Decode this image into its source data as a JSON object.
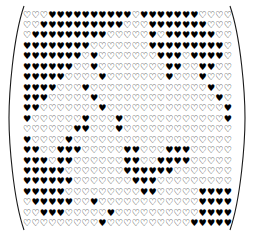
{
  "figure": {
    "kind": "heart-glyph-matrix",
    "rows": 21,
    "cols": 25,
    "glyphs": {
      "filled": "♥",
      "outline": "♡"
    },
    "colors": {
      "ink": "#000000",
      "bracket": "#1a1a1a",
      "background": "#ffffff"
    },
    "bracket_left_name": "left-parenthesis",
    "bracket_right_name": "right-parenthesis"
  },
  "chart_data": {
    "type": "heatmap",
    "title": "",
    "xlabel": "",
    "ylabel": "",
    "legend": [
      "filled = 1",
      "outline = 0"
    ],
    "rows": 21,
    "cols": 25,
    "matrix": [
      [
        0,
        0,
        0,
        1,
        1,
        1,
        1,
        1,
        1,
        1,
        1,
        1,
        1,
        0,
        1,
        1,
        1,
        1,
        1,
        1,
        1,
        0,
        0,
        0,
        0
      ],
      [
        0,
        0,
        1,
        1,
        1,
        1,
        1,
        1,
        1,
        1,
        1,
        1,
        0,
        0,
        0,
        1,
        1,
        1,
        1,
        1,
        1,
        1,
        0,
        0,
        0
      ],
      [
        0,
        1,
        1,
        1,
        1,
        1,
        1,
        1,
        1,
        1,
        0,
        0,
        0,
        0,
        0,
        1,
        0,
        1,
        1,
        1,
        1,
        1,
        1,
        0,
        0
      ],
      [
        1,
        1,
        1,
        1,
        1,
        1,
        1,
        1,
        0,
        0,
        0,
        0,
        0,
        0,
        0,
        1,
        1,
        1,
        1,
        1,
        1,
        1,
        1,
        1,
        0
      ],
      [
        1,
        1,
        1,
        1,
        1,
        1,
        1,
        0,
        1,
        0,
        0,
        0,
        0,
        0,
        0,
        0,
        1,
        1,
        1,
        0,
        1,
        1,
        1,
        1,
        0
      ],
      [
        1,
        1,
        1,
        1,
        1,
        1,
        0,
        0,
        1,
        0,
        0,
        0,
        0,
        0,
        0,
        0,
        0,
        1,
        1,
        0,
        0,
        1,
        1,
        0,
        0
      ],
      [
        1,
        1,
        1,
        1,
        1,
        0,
        0,
        0,
        0,
        1,
        0,
        0,
        0,
        0,
        0,
        0,
        0,
        1,
        0,
        0,
        0,
        1,
        0,
        0,
        0
      ],
      [
        1,
        1,
        1,
        1,
        0,
        0,
        0,
        1,
        0,
        0,
        0,
        0,
        0,
        0,
        0,
        0,
        0,
        0,
        0,
        0,
        0,
        0,
        1,
        0,
        0
      ],
      [
        1,
        1,
        1,
        0,
        0,
        0,
        0,
        0,
        1,
        0,
        0,
        0,
        0,
        0,
        0,
        0,
        0,
        0,
        0,
        0,
        0,
        0,
        0,
        1,
        0
      ],
      [
        1,
        1,
        0,
        0,
        0,
        0,
        0,
        0,
        0,
        1,
        0,
        0,
        0,
        0,
        0,
        0,
        0,
        0,
        0,
        0,
        0,
        0,
        0,
        0,
        1
      ],
      [
        1,
        0,
        0,
        0,
        0,
        0,
        0,
        1,
        0,
        0,
        0,
        1,
        0,
        0,
        0,
        0,
        0,
        0,
        0,
        0,
        0,
        0,
        0,
        0,
        1
      ],
      [
        0,
        0,
        0,
        0,
        0,
        0,
        1,
        1,
        0,
        0,
        0,
        1,
        0,
        0,
        0,
        0,
        0,
        0,
        0,
        0,
        0,
        0,
        0,
        0,
        0
      ],
      [
        1,
        0,
        0,
        0,
        0,
        1,
        0,
        0,
        0,
        0,
        0,
        0,
        0,
        0,
        0,
        0,
        0,
        0,
        0,
        0,
        0,
        0,
        0,
        0,
        0
      ],
      [
        1,
        1,
        0,
        0,
        1,
        1,
        1,
        0,
        0,
        0,
        0,
        0,
        1,
        1,
        0,
        0,
        0,
        1,
        1,
        1,
        0,
        0,
        0,
        0,
        0
      ],
      [
        1,
        1,
        1,
        0,
        1,
        1,
        0,
        0,
        0,
        0,
        0,
        0,
        1,
        1,
        0,
        0,
        1,
        1,
        1,
        1,
        0,
        0,
        0,
        0,
        0
      ],
      [
        1,
        1,
        1,
        1,
        1,
        0,
        0,
        0,
        0,
        0,
        0,
        0,
        1,
        1,
        1,
        1,
        1,
        1,
        0,
        0,
        0,
        0,
        0,
        0,
        0
      ],
      [
        1,
        1,
        1,
        1,
        1,
        1,
        0,
        0,
        0,
        0,
        0,
        0,
        0,
        1,
        1,
        1,
        0,
        0,
        0,
        0,
        0,
        0,
        0,
        0,
        0
      ],
      [
        1,
        1,
        1,
        1,
        1,
        0,
        0,
        0,
        0,
        0,
        0,
        0,
        0,
        0,
        1,
        1,
        0,
        0,
        0,
        0,
        0,
        1,
        1,
        1,
        1
      ],
      [
        0,
        1,
        1,
        1,
        1,
        1,
        0,
        0,
        1,
        0,
        0,
        0,
        0,
        0,
        0,
        0,
        0,
        0,
        0,
        0,
        0,
        1,
        1,
        1,
        1
      ],
      [
        0,
        0,
        1,
        1,
        1,
        0,
        0,
        0,
        0,
        0,
        1,
        0,
        0,
        0,
        0,
        0,
        0,
        0,
        0,
        0,
        0,
        1,
        1,
        1,
        1
      ],
      [
        0,
        0,
        0,
        0,
        0,
        0,
        0,
        0,
        0,
        1,
        0,
        0,
        0,
        0,
        0,
        0,
        0,
        0,
        0,
        0,
        1,
        1,
        1,
        1,
        1
      ]
    ]
  }
}
